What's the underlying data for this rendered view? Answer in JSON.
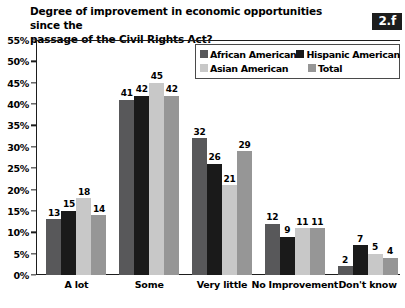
{
  "badge": {
    "label": "2.f"
  },
  "title": {
    "line1": "Degree of improvement in economic opportunities since the",
    "line2": "passage of the Civil Rights Act?"
  },
  "colors": {
    "african_american": "#58585a",
    "hispanic_american": "#1a1a1a",
    "asian_american": "#c8c8c8",
    "total": "#969696",
    "axis": "#1d1d1d",
    "badge_bg": "#1d1d1d",
    "badge_text": "#ffffff",
    "background": "#ffffff"
  },
  "legend": {
    "items": [
      {
        "label": "African American",
        "color": "#58585a"
      },
      {
        "label": "Hispanic American",
        "color": "#1a1a1a"
      },
      {
        "label": "Asian American",
        "color": "#c8c8c8"
      },
      {
        "label": "Total",
        "color": "#969696"
      }
    ]
  },
  "yaxis": {
    "ticks": [
      "55%",
      "50%",
      "45%",
      "40%",
      "35%",
      "30%",
      "25%",
      "20%",
      "15%",
      "10%",
      "5%",
      "0%"
    ]
  },
  "chart_data": {
    "type": "bar",
    "title": "Degree of improvement in economic opportunities since the passage of the Civil Rights Act?",
    "xlabel": "",
    "ylabel": "",
    "ylim": [
      0,
      55
    ],
    "ytick_step": 5,
    "grid": false,
    "legend_position": "top-right-inside",
    "categories": [
      "A lot",
      "Some",
      "Very little",
      "No Improvement",
      "Don't know"
    ],
    "series": [
      {
        "name": "African American",
        "color": "#58585a",
        "values": [
          13,
          41,
          32,
          12,
          2
        ]
      },
      {
        "name": "Hispanic American",
        "color": "#1a1a1a",
        "values": [
          15,
          42,
          26,
          9,
          7
        ]
      },
      {
        "name": "Asian American",
        "color": "#c8c8c8",
        "values": [
          18,
          45,
          21,
          11,
          5
        ]
      },
      {
        "name": "Total",
        "color": "#969696",
        "values": [
          14,
          42,
          29,
          11,
          4
        ]
      }
    ]
  }
}
